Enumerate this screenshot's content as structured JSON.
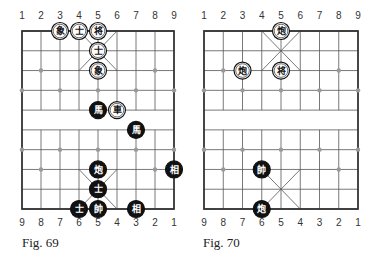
{
  "figures": [
    {
      "caption": "Fig. 69",
      "top_labels": [
        "1",
        "2",
        "3",
        "4",
        "5",
        "6",
        "7",
        "8",
        "9"
      ],
      "bottom_labels": [
        "9",
        "8",
        "7",
        "6",
        "5",
        "4",
        "3",
        "2",
        "1"
      ],
      "pieces": [
        {
          "side": "white",
          "char": "象",
          "col": 3,
          "row": 0
        },
        {
          "side": "white",
          "char": "士",
          "col": 4,
          "row": 0
        },
        {
          "side": "white",
          "char": "将",
          "col": 5,
          "row": 0
        },
        {
          "side": "white",
          "char": "士",
          "col": 5,
          "row": 1
        },
        {
          "side": "white",
          "char": "象",
          "col": 5,
          "row": 2
        },
        {
          "side": "black",
          "char": "馬",
          "col": 5,
          "row": 4
        },
        {
          "side": "white",
          "char": "車",
          "col": 6,
          "row": 4
        },
        {
          "side": "black",
          "char": "馬",
          "col": 7,
          "row": 5
        },
        {
          "side": "black",
          "char": "相",
          "col": 9,
          "row": 7
        },
        {
          "side": "black",
          "char": "炮",
          "col": 5,
          "row": 7
        },
        {
          "side": "black",
          "char": "士",
          "col": 5,
          "row": 8
        },
        {
          "side": "black",
          "char": "士",
          "col": 4,
          "row": 9
        },
        {
          "side": "black",
          "char": "帥",
          "col": 5,
          "row": 9
        },
        {
          "side": "black",
          "char": "相",
          "col": 7,
          "row": 9
        }
      ]
    },
    {
      "caption": "Fig. 70",
      "top_labels": [
        "1",
        "2",
        "3",
        "4",
        "5",
        "6",
        "7",
        "8",
        "9"
      ],
      "bottom_labels": [
        "9",
        "8",
        "7",
        "6",
        "5",
        "4",
        "3",
        "2",
        "1"
      ],
      "pieces": [
        {
          "side": "white",
          "char": "炮",
          "col": 5,
          "row": 0
        },
        {
          "side": "white",
          "char": "炮",
          "col": 3,
          "row": 2
        },
        {
          "side": "white",
          "char": "将",
          "col": 5,
          "row": 2
        },
        {
          "side": "black",
          "char": "帥",
          "col": 4,
          "row": 7
        },
        {
          "side": "black",
          "char": "炮",
          "col": 4,
          "row": 9
        }
      ]
    }
  ],
  "colors": {
    "board_line": "#555555",
    "border": "#333333",
    "marker": "#999999",
    "black_piece": "#111111",
    "white_piece": "#ffffff"
  }
}
